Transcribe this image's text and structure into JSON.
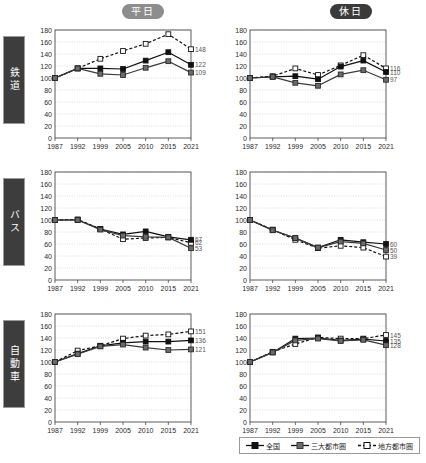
{
  "columns": [
    {
      "id": "weekday",
      "label": "平日"
    },
    {
      "id": "holiday",
      "label": "休日"
    }
  ],
  "rows": [
    {
      "id": "rail",
      "label": "鉄道"
    },
    {
      "id": "bus",
      "label": "バス"
    },
    {
      "id": "car",
      "label": "自動車"
    }
  ],
  "legend": {
    "items": [
      {
        "name": "全国",
        "marker": "filled-square-black",
        "line": "solid",
        "color": "#111111"
      },
      {
        "name": "三大都市圏",
        "marker": "filled-square-gray",
        "line": "solid",
        "color": "#6b6b6b"
      },
      {
        "name": "地方都市圏",
        "marker": "open-square",
        "line": "dashed",
        "color": "#111111"
      }
    ]
  },
  "axis": {
    "x_ticks": [
      "1987",
      "1992",
      "1999",
      "2005",
      "2010",
      "2015",
      "2021"
    ],
    "y_ticks": [
      "0",
      "20",
      "40",
      "60",
      "80",
      "100",
      "120",
      "140",
      "160",
      "180"
    ],
    "ylim": [
      0,
      180
    ],
    "grid": true
  },
  "chart_data": [
    {
      "type": "line",
      "title": "鉄道 / 平日",
      "row": "鉄道",
      "column": "平日",
      "xlabel": "",
      "ylabel": "",
      "ylim": [
        0,
        180
      ],
      "categories": [
        "1987",
        "1992",
        "1999",
        "2005",
        "2010",
        "2015",
        "2021"
      ],
      "series": [
        {
          "name": "全国",
          "values": [
            100,
            116,
            116,
            115,
            129,
            143,
            122
          ],
          "end_label": "122"
        },
        {
          "name": "三大都市圏",
          "values": [
            100,
            116,
            107,
            105,
            117,
            128,
            109
          ],
          "end_label": "109"
        },
        {
          "name": "地方都市圏",
          "values": [
            100,
            116,
            132,
            145,
            157,
            173,
            148
          ],
          "end_label": "148"
        }
      ]
    },
    {
      "type": "line",
      "title": "鉄道 / 休日",
      "row": "鉄道",
      "column": "休日",
      "xlabel": "",
      "ylabel": "",
      "ylim": [
        0,
        180
      ],
      "categories": [
        "1987",
        "1992",
        "1999",
        "2005",
        "2010",
        "2015",
        "2021"
      ],
      "series": [
        {
          "name": "全国",
          "values": [
            100,
            102,
            103,
            98,
            119,
            129,
            110
          ],
          "end_label": "110"
        },
        {
          "name": "三大都市圏",
          "values": [
            100,
            102,
            92,
            87,
            106,
            113,
            97
          ],
          "end_label": "97"
        },
        {
          "name": "地方都市圏",
          "values": [
            100,
            103,
            116,
            105,
            121,
            138,
            116
          ],
          "end_label": "116"
        }
      ]
    },
    {
      "type": "line",
      "title": "バス / 平日",
      "row": "バス",
      "column": "平日",
      "xlabel": "",
      "ylabel": "",
      "ylim": [
        0,
        180
      ],
      "categories": [
        "1987",
        "1992",
        "1999",
        "2005",
        "2010",
        "2015",
        "2021"
      ],
      "series": [
        {
          "name": "全国",
          "values": [
            100,
            100,
            85,
            76,
            81,
            72,
            67
          ],
          "end_label": "67"
        },
        {
          "name": "三大都市圏",
          "values": [
            100,
            100,
            84,
            74,
            72,
            71,
            53
          ],
          "end_label": "53"
        },
        {
          "name": "地方都市圏",
          "values": [
            100,
            101,
            85,
            68,
            70,
            71,
            62
          ],
          "end_label": "62"
        }
      ]
    },
    {
      "type": "line",
      "title": "バス / 休日",
      "row": "バス",
      "column": "休日",
      "xlabel": "",
      "ylabel": "",
      "ylim": [
        0,
        180
      ],
      "categories": [
        "1987",
        "1992",
        "1999",
        "2005",
        "2010",
        "2015",
        "2021"
      ],
      "series": [
        {
          "name": "全国",
          "values": [
            100,
            83,
            70,
            54,
            67,
            63,
            60
          ],
          "end_label": "60"
        },
        {
          "name": "三大都市圏",
          "values": [
            100,
            83,
            70,
            54,
            64,
            61,
            50
          ],
          "end_label": "50"
        },
        {
          "name": "地方都市圏",
          "values": [
            100,
            84,
            67,
            53,
            57,
            54,
            39
          ],
          "end_label": "39"
        }
      ]
    },
    {
      "type": "line",
      "title": "自動車 / 平日",
      "row": "自動車",
      "column": "平日",
      "xlabel": "",
      "ylabel": "",
      "ylim": [
        0,
        180
      ],
      "categories": [
        "1987",
        "1992",
        "1999",
        "2005",
        "2010",
        "2015",
        "2021"
      ],
      "series": [
        {
          "name": "全国",
          "values": [
            100,
            114,
            127,
            132,
            134,
            134,
            136
          ],
          "end_label": "136"
        },
        {
          "name": "三大都市圏",
          "values": [
            100,
            113,
            126,
            129,
            124,
            120,
            121
          ],
          "end_label": "121"
        },
        {
          "name": "地方都市圏",
          "values": [
            100,
            119,
            127,
            139,
            144,
            146,
            151
          ],
          "end_label": "151"
        }
      ]
    },
    {
      "type": "line",
      "title": "自動車 / 休日",
      "row": "自動車",
      "column": "休日",
      "xlabel": "",
      "ylabel": "",
      "ylim": [
        0,
        180
      ],
      "categories": [
        "1987",
        "1992",
        "1999",
        "2005",
        "2010",
        "2015",
        "2021"
      ],
      "series": [
        {
          "name": "全国",
          "values": [
            100,
            116,
            139,
            140,
            136,
            138,
            135
          ],
          "end_label": "135"
        },
        {
          "name": "三大都市圏",
          "values": [
            100,
            116,
            136,
            139,
            135,
            137,
            128
          ],
          "end_label": "128"
        },
        {
          "name": "地方都市圏",
          "values": [
            100,
            117,
            130,
            141,
            139,
            139,
            145
          ],
          "end_label": "145"
        }
      ]
    }
  ]
}
